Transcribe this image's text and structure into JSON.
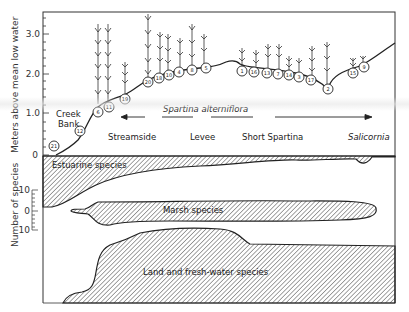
{
  "title": "",
  "top_panel": {
    "ylabel": "Meters above mean low water",
    "yticks": [
      "0",
      "1.0",
      "2.0",
      "3.0"
    ],
    "zones": [
      "Creek Bank",
      "Streamside",
      "Levee",
      "Short Spartina",
      "Salicornia"
    ],
    "species_label": "Spartina alterniflora",
    "station_numbers": [
      "21",
      "12",
      "6",
      "11",
      "19",
      "20",
      "18",
      "10",
      "4",
      "8",
      "5",
      "1",
      "16",
      "13",
      "7",
      "14",
      "3",
      "17",
      "2",
      "15",
      "9"
    ]
  },
  "bottom_panel": {
    "ylabel": "Number of species",
    "yticks": [
      "10",
      "0",
      "10"
    ],
    "groups": [
      "Estuarine species",
      "Marsh species",
      "Land and fresh-water species"
    ]
  },
  "colors": {
    "ink": "#222222",
    "background": "#ffffff",
    "hatch": "#333333"
  }
}
